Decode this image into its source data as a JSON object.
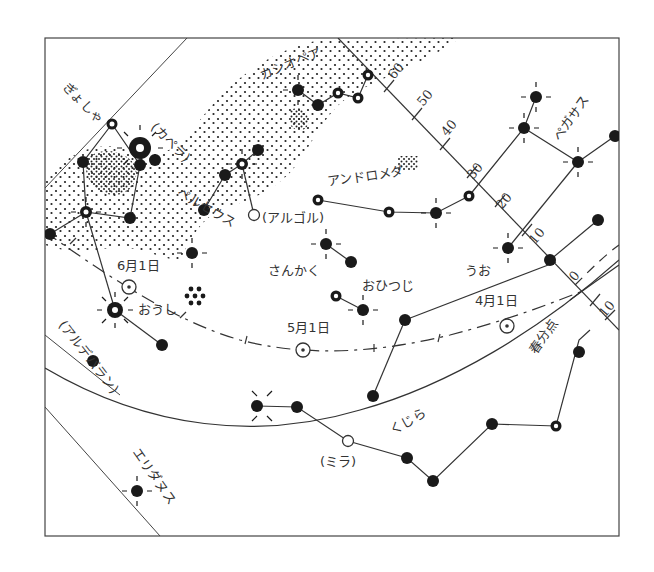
{
  "chart": {
    "frame": {
      "x": 45,
      "y": 38,
      "width": 574,
      "height": 498
    },
    "ink_color": "#333333",
    "background": "#ffffff"
  },
  "constellations": [
    {
      "label": "ぎょしゃ",
      "x": 62,
      "y": 88,
      "rotate": 45
    },
    {
      "label": "カシオペア",
      "x": 262,
      "y": 80,
      "rotate": -22
    },
    {
      "label": "ペルセウス",
      "x": 176,
      "y": 195,
      "rotate": 30
    },
    {
      "label": "アンドロメダ",
      "x": 328,
      "y": 186,
      "rotate": -8
    },
    {
      "label": "ペガサス",
      "x": 560,
      "y": 142,
      "rotate": -55
    },
    {
      "label": "さんかく",
      "x": 268,
      "y": 275,
      "rotate": 0
    },
    {
      "label": "おひつじ",
      "x": 362,
      "y": 290,
      "rotate": 0
    },
    {
      "label": "うお",
      "x": 465,
      "y": 275,
      "rotate": 0
    },
    {
      "label": "おうし",
      "x": 138,
      "y": 314,
      "rotate": 0
    },
    {
      "label": "くじら",
      "x": 393,
      "y": 435,
      "rotate": -30
    },
    {
      "label": "エリダヌス",
      "x": 132,
      "y": 452,
      "rotate": 55
    }
  ],
  "star_names": [
    {
      "label": "(カペラ)",
      "x": 150,
      "y": 128,
      "rotate": 45
    },
    {
      "label": "(アルゴル)",
      "x": 262,
      "y": 222,
      "rotate": 0
    },
    {
      "label": "(アルデバラン)",
      "x": 58,
      "y": 325,
      "rotate": 52
    },
    {
      "label": "(ミラ)",
      "x": 320,
      "y": 466,
      "rotate": 0
    }
  ],
  "sun_positions": [
    {
      "label": "6月1日",
      "x": 117,
      "y": 270,
      "marker_x": 129,
      "marker_y": 287
    },
    {
      "label": "5月1日",
      "x": 287,
      "y": 332,
      "marker_x": 303,
      "marker_y": 350
    },
    {
      "label": "4月1日",
      "x": 475,
      "y": 305,
      "marker_x": 507,
      "marker_y": 326
    }
  ],
  "special_points": [
    {
      "label": "春分点",
      "x": 536,
      "y": 355,
      "rotate": -55
    }
  ],
  "declination_ticks": [
    {
      "label": "60",
      "x": 394,
      "y": 80
    },
    {
      "label": "50",
      "x": 423,
      "y": 107
    },
    {
      "label": "40",
      "x": 447,
      "y": 137
    },
    {
      "label": "30",
      "x": 473,
      "y": 180
    },
    {
      "label": "20",
      "x": 502,
      "y": 210
    },
    {
      "label": "10",
      "x": 535,
      "y": 245
    },
    {
      "label": "0",
      "x": 575,
      "y": 282
    },
    {
      "label": "10",
      "x": 605,
      "y": 318
    }
  ],
  "clusters": [
    {
      "name": "pleiades",
      "x": 196,
      "y": 297
    },
    {
      "name": "andromeda-galaxy",
      "x": 408,
      "y": 162
    }
  ]
}
